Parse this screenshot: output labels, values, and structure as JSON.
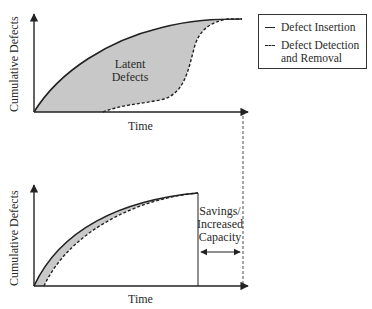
{
  "diagram": {
    "top_chart": {
      "y_axis_label": "Cumulative Defects",
      "x_axis_label": "Time",
      "shaded_region_label_line1": "Latent",
      "shaded_region_label_line2": "Defects"
    },
    "bottom_chart": {
      "y_axis_label": "Cumulative Defects",
      "x_axis_label": "Time",
      "annotation_line1": "Savings/",
      "annotation_line2": "Increased",
      "annotation_line3": "Capacity"
    },
    "legend": {
      "items": [
        {
          "style": "solid",
          "label": "Defect Insertion"
        },
        {
          "style": "dashed",
          "label_line1": "Defect Detection",
          "label_line2": "and Removal"
        }
      ]
    },
    "colors": {
      "shade": "#c8c8c8",
      "line": "#222222"
    }
  }
}
